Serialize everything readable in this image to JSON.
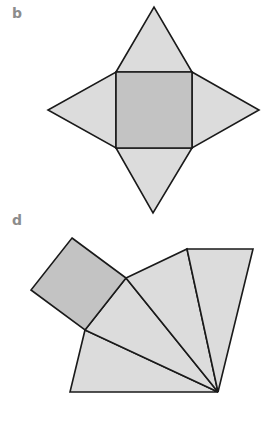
{
  "figures": [
    {
      "label": "b",
      "description": "Net of a square pyramid: square base with four triangular faces attached to each side",
      "base": {
        "shape": "square",
        "points": [
          [
            116,
            72
          ],
          [
            192,
            72
          ],
          [
            192,
            148
          ],
          [
            116,
            148
          ]
        ],
        "fill": "#c3c3c3"
      },
      "faces": [
        {
          "name": "top-triangle",
          "points": [
            [
              116,
              72
            ],
            [
              154,
              7
            ],
            [
              192,
              72
            ]
          ],
          "fill": "#dcdcdc"
        },
        {
          "name": "right-triangle",
          "points": [
            [
              192,
              72
            ],
            [
              259,
              110
            ],
            [
              192,
              148
            ]
          ],
          "fill": "#dcdcdc"
        },
        {
          "name": "bottom-triangle",
          "points": [
            [
              116,
              148
            ],
            [
              192,
              148
            ],
            [
              153,
              213
            ]
          ],
          "fill": "#dcdcdc"
        },
        {
          "name": "left-triangle",
          "points": [
            [
              116,
              72
            ],
            [
              116,
              148
            ],
            [
              48,
              110
            ]
          ],
          "fill": "#dcdcdc"
        }
      ]
    },
    {
      "label": "d",
      "description": "Alternative net: tilted square base with four triangular faces fanning out from a common apex",
      "base": {
        "shape": "square",
        "points": [
          [
            72,
            238
          ],
          [
            126,
            278
          ],
          [
            85,
            330
          ],
          [
            31,
            290
          ]
        ],
        "fill": "#c3c3c3"
      },
      "faces": [
        {
          "name": "fan-triangle-1",
          "points": [
            [
              85,
              330
            ],
            [
              218,
              392
            ],
            [
              70,
              392
            ]
          ],
          "fill": "#dcdcdc"
        },
        {
          "name": "fan-triangle-2",
          "points": [
            [
              85,
              330
            ],
            [
              126,
              278
            ],
            [
              218,
              392
            ]
          ],
          "fill": "#dcdcdc"
        },
        {
          "name": "fan-triangle-3",
          "points": [
            [
              126,
              278
            ],
            [
              187,
              249
            ],
            [
              218,
              392
            ]
          ],
          "fill": "#dcdcdc"
        },
        {
          "name": "fan-triangle-4",
          "points": [
            [
              187,
              249
            ],
            [
              253,
              249
            ],
            [
              218,
              392
            ]
          ],
          "fill": "#dcdcdc"
        }
      ]
    }
  ],
  "colors": {
    "label": "#8c8c8c",
    "base_fill": "#c3c3c3",
    "face_fill": "#dcdcdc",
    "stroke": "#1a1a1a",
    "background": "#ffffff"
  }
}
